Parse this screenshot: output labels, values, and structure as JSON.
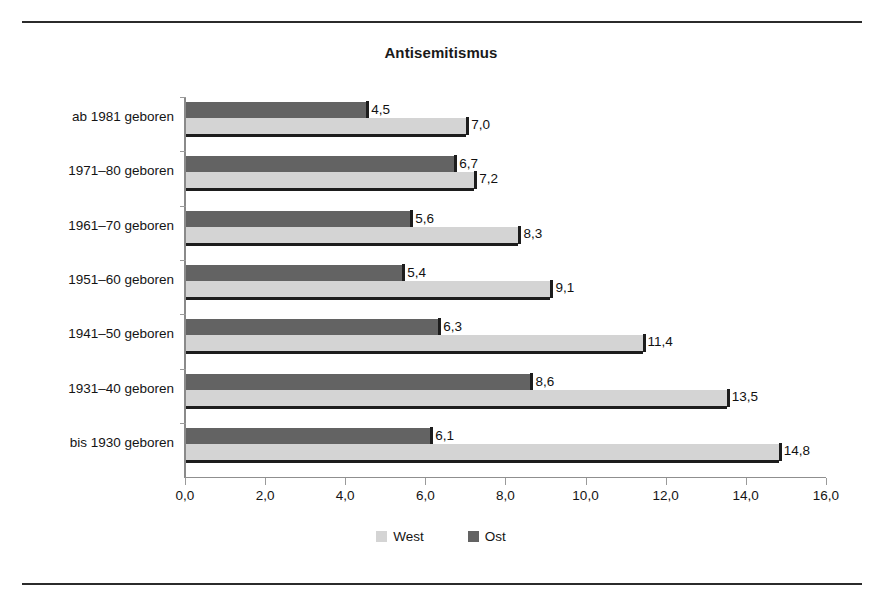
{
  "page": {
    "top_cropped_text": "",
    "rules": {
      "top": "divider",
      "bottom": "divider"
    }
  },
  "legend": {
    "west_label": "West",
    "ost_label": "Ost",
    "west_color": "#d4d4d4",
    "ost_color": "#636363"
  },
  "chart_data": {
    "type": "bar",
    "orientation": "horizontal",
    "title": "Antisemitismus",
    "xlabel": "",
    "ylabel": "",
    "xlim": [
      0,
      16
    ],
    "xticks": [
      0,
      2,
      4,
      6,
      8,
      10,
      12,
      14,
      16
    ],
    "xtick_labels": [
      "0,0",
      "2,0",
      "4,0",
      "6,0",
      "8,0",
      "10,0",
      "12,0",
      "14,0",
      "16,0"
    ],
    "grid": false,
    "legend_position": "bottom-center",
    "categories": [
      "ab 1981 geboren",
      "1971–80 geboren",
      "1961–70 geboren",
      "1951–60 geboren",
      "1941–50 geboren",
      "1931–40 geboren",
      "bis 1930 geboren"
    ],
    "series": [
      {
        "name": "Ost",
        "color": "#636363",
        "values": [
          4.5,
          6.7,
          5.6,
          5.4,
          6.3,
          8.6,
          6.1
        ],
        "labels": [
          "4,5",
          "6,7",
          "5,6",
          "5,4",
          "6,3",
          "8,6",
          "6,1"
        ]
      },
      {
        "name": "West",
        "color": "#d4d4d4",
        "values": [
          7.0,
          7.2,
          8.3,
          9.1,
          11.4,
          13.5,
          14.8
        ],
        "labels": [
          "7,0",
          "7,2",
          "8,3",
          "9,1",
          "11,4",
          "13,5",
          "14,8"
        ]
      }
    ]
  }
}
